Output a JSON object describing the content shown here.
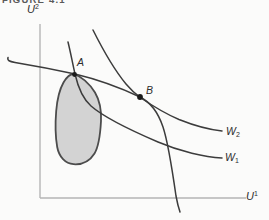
{
  "figure": {
    "caption": "FIGURE 4.1",
    "axes": {
      "y_label": {
        "base": "U",
        "script": "2"
      },
      "x_label": {
        "base": "U",
        "script": "1"
      }
    },
    "points": [
      {
        "label": "A"
      },
      {
        "label": "B"
      }
    ],
    "curves": [
      {
        "name": "utility-possibility-frontier"
      },
      {
        "name": "welfare-contour-w1",
        "label": {
          "base": "W",
          "script": "1"
        }
      },
      {
        "name": "welfare-contour-w2",
        "label": {
          "base": "W",
          "script": "2"
        }
      }
    ],
    "region": {
      "name": "feasible-utility-set"
    },
    "colors": {
      "background": "#fbfbfa",
      "text": "#2e2e2e",
      "curve": "#3c3c3c",
      "axis": "#b5b5b5",
      "region_fill": "#d3d3d3",
      "region_outline": "#4c4c4c",
      "point": "#1a1a1a"
    }
  }
}
